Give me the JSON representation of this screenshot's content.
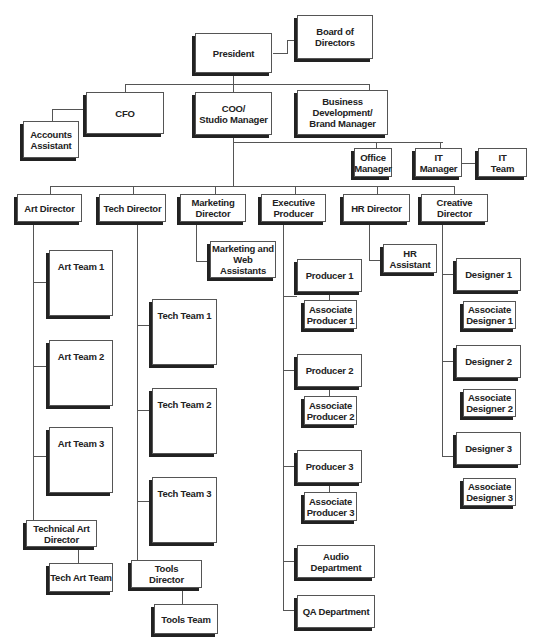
{
  "chart": {
    "executive": {
      "president": "President",
      "board": "Board of\nDirectors"
    },
    "level1": {
      "cfo": "CFO",
      "accounts_assistant": "Accounts\nAssistant",
      "coo": "COO/\nStudio Manager",
      "biz_dev": "Business Development/\nBrand Manager"
    },
    "support": {
      "office_manager": "Office\nManager",
      "it_manager": "IT\nManager",
      "it_team": "IT\nTeam"
    },
    "directors": [
      {
        "label": "Art Director"
      },
      {
        "label": "Tech Director"
      },
      {
        "label": "Marketing\nDirector"
      },
      {
        "label": "Executive\nProducer"
      },
      {
        "label": "HR Director"
      },
      {
        "label": "Creative Director"
      }
    ],
    "art": {
      "teams": [
        "Art Team 1",
        "Art Team 2",
        "Art Team 3"
      ],
      "technical_art_director": "Technical  Art\nDirector",
      "tech_art_team": "Tech Art Team"
    },
    "tech": {
      "teams": [
        "Tech Team 1",
        "Tech Team 2",
        "Tech Team 3"
      ],
      "tools_director": "Tools\nDirector",
      "tools_team": "Tools Team"
    },
    "marketing": {
      "assistants": "Marketing and\nWeb Assistants"
    },
    "production": {
      "producers": [
        "Producer 1",
        "Producer 2",
        "Producer 3"
      ],
      "associates": [
        "Associate\nProducer 1",
        "Associate\nProducer 2",
        "Associate\nProducer 3"
      ],
      "audio": "Audio Department",
      "qa": "QA Department"
    },
    "hr": {
      "assistant": "HR\nAssistant"
    },
    "creative": {
      "designers": [
        "Designer 1",
        "Designer 2",
        "Designer 3"
      ],
      "associates": [
        "Associate\nDesigner 1",
        "Associate\nDesigner 2",
        "Associate\nDesigner 3"
      ]
    }
  }
}
